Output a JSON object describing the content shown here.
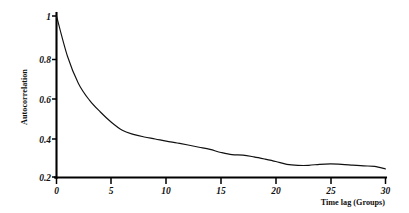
{
  "chart_data": {
    "type": "line",
    "title": "",
    "xlabel": "Time lag (Groups)",
    "ylabel": "Autocorrelation",
    "xlim": [
      0,
      30
    ],
    "ylim": [
      0.2,
      1.0
    ],
    "grid": false,
    "legend": false,
    "legend_position": "none",
    "xticks": [
      0,
      5,
      10,
      15,
      20,
      25,
      30
    ],
    "xtick_labels": [
      "0",
      "5",
      "10",
      "15",
      "20",
      "25",
      "30"
    ],
    "yticks": [
      0.2,
      0.4,
      0.6,
      0.8,
      1.0
    ],
    "ytick_labels": [
      "0.2",
      "0.4",
      "0.6",
      "0.8",
      "1"
    ],
    "series": [
      {
        "name": "autocorrelation",
        "color": "#111111",
        "x": [
          0,
          1,
          2,
          3,
          4,
          5,
          6,
          7,
          8,
          9,
          10,
          11,
          12,
          13,
          14,
          15,
          16,
          17,
          18,
          19,
          20,
          21,
          22,
          23,
          24,
          25,
          26,
          27,
          28,
          29,
          30
        ],
        "values": [
          1.0,
          0.8,
          0.665,
          0.582,
          0.523,
          0.472,
          0.432,
          0.412,
          0.399,
          0.389,
          0.378,
          0.369,
          0.359,
          0.348,
          0.337,
          0.322,
          0.311,
          0.309,
          0.3,
          0.289,
          0.277,
          0.263,
          0.258,
          0.258,
          0.263,
          0.265,
          0.263,
          0.259,
          0.255,
          0.253,
          0.24
        ]
      }
    ]
  },
  "axes": {
    "y_axis_title": "Autocorrelation",
    "x_axis_title": "Time lag (Groups)"
  }
}
